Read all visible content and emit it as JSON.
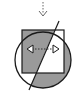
{
  "diagram": {
    "title": "Reflection symmetry icon",
    "elements": {
      "down_arrow": "dashed-down-arrow-icon",
      "circle": "circle-shape",
      "square": "square-shape",
      "mirror_line": "diagonal-mirror-line",
      "double_arrow": "dashed-double-arrow-icon"
    },
    "colors": {
      "stroke": "#1a1a1a",
      "fill_gray": "#9a9a9a",
      "fill_white": "#ffffff",
      "dashed": "#555555"
    }
  }
}
